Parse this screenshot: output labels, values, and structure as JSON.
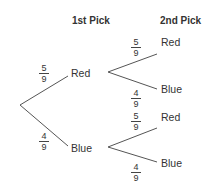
{
  "headers": {
    "first": "1st Pick",
    "second": "2nd Pick"
  },
  "first_pick": {
    "red": {
      "label": "Red",
      "prob": {
        "num": "5",
        "den": "9"
      }
    },
    "blue": {
      "label": "Blue",
      "prob": {
        "num": "4",
        "den": "9"
      }
    }
  },
  "second_pick": {
    "after_red": {
      "red": {
        "label": "Red",
        "prob": {
          "num": "5",
          "den": "9"
        }
      },
      "blue": {
        "label": "Blue",
        "prob": {
          "num": "4",
          "den": "9"
        }
      }
    },
    "after_blue": {
      "red": {
        "label": "Red",
        "prob": {
          "num": "5",
          "den": "9"
        }
      },
      "blue": {
        "label": "Blue",
        "prob": {
          "num": "4",
          "den": "9"
        }
      }
    }
  }
}
